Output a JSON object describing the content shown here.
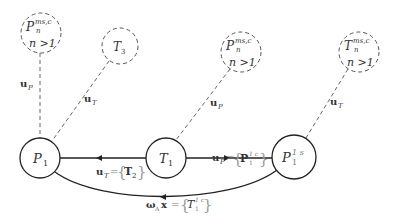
{
  "diagram": {
    "nodes": {
      "p1": {
        "main": "P",
        "sub": "1"
      },
      "t1": {
        "main": "T",
        "sub": "1"
      },
      "p1s": {
        "main": "P",
        "sup": "1 s",
        "sub": "1"
      },
      "pn_left": {
        "main": "P",
        "sup": "ms,c",
        "sub": "n",
        "cond": "n >1"
      },
      "t3": {
        "main": "T",
        "sub": "3"
      },
      "pn_mid": {
        "main": "P",
        "sup": "ms,c",
        "sub": "n",
        "cond": "n >1"
      },
      "tn_right": {
        "main": "T",
        "sup": "ms,c",
        "sub": "n",
        "cond": "n >1"
      }
    },
    "edge_labels": {
      "up_left": {
        "main": "u",
        "sub": "P"
      },
      "ut_t3": {
        "main": "u",
        "sub": "T"
      },
      "up_mid": {
        "main": "u",
        "sub": "P"
      },
      "ut_right": {
        "main": "u",
        "sub": "T"
      },
      "p1_t1": {
        "main": "u",
        "sub": "T",
        "eq": "=",
        "open": "{",
        "set_main": "T",
        "set_sub": "2",
        "close": "}"
      },
      "t1_p1s": {
        "main": "u",
        "sub": "P",
        "eq": "=",
        "open": "{",
        "set_main": "P",
        "set_sup": "1 c",
        "set_sub": "1",
        "close": "}"
      },
      "p1s_p1": {
        "main": "ω",
        "sub": "A",
        "x": "x",
        "eq": "=",
        "open": "{",
        "set_main": "T",
        "set_sup": "1 c",
        "set_sub": "1",
        "close": "}"
      }
    }
  }
}
